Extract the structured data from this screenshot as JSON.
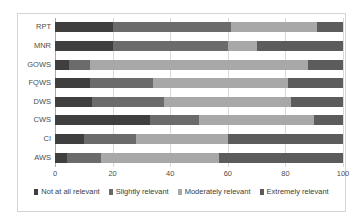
{
  "chart_data": {
    "type": "bar",
    "orientation": "horizontal",
    "stacked": true,
    "stack_mode": "percent",
    "title": "",
    "xlabel": "",
    "ylabel": "",
    "xlim": [
      0,
      100
    ],
    "xticks": [
      "0",
      "20",
      "40",
      "60",
      "80",
      "100"
    ],
    "xtick_values": [
      0,
      20,
      40,
      60,
      80,
      100
    ],
    "grid": true,
    "grid_axis": "x",
    "legend_position": "bottom",
    "categories": [
      "AWS",
      "CI",
      "CWS",
      "DWS",
      "FQWS",
      "GOWS",
      "MNR",
      "RPT"
    ],
    "categories_top_to_bottom": [
      "RPT",
      "MNR",
      "GOWS",
      "FQWS",
      "DWS",
      "CWS",
      "CI",
      "AWS"
    ],
    "series": [
      {
        "name": "Not at all relevant",
        "color": "#3f3f3f",
        "values": [
          4,
          10,
          33,
          13,
          12,
          5,
          20,
          20
        ]
      },
      {
        "name": "Slightly relevant",
        "color": "#6b6b6b",
        "values": [
          12,
          18,
          17,
          25,
          22,
          7,
          40,
          41
        ]
      },
      {
        "name": "Moderately relevant",
        "color": "#a8a8a8",
        "values": [
          41,
          32,
          40,
          44,
          47,
          76,
          10,
          30
        ]
      },
      {
        "name": "Extremely relevant",
        "color": "#5c5c5c",
        "values": [
          43,
          40,
          10,
          18,
          19,
          12,
          30,
          9
        ]
      }
    ]
  },
  "legend": {
    "items": [
      {
        "label": "Not at all relevant",
        "color": "#3f3f3f"
      },
      {
        "label": "Slightly relevant",
        "color": "#6b6b6b"
      },
      {
        "label": "Moderately relevant",
        "color": "#a8a8a8"
      },
      {
        "label": "Extremely relevant",
        "color": "#5c5c5c"
      }
    ]
  },
  "colors": {
    "background": "#ffffff",
    "frame": "#d4d4d4",
    "gridline": "#d9d9d9",
    "axis": "#aaaaaa",
    "tick_text": "#4d4d4d"
  }
}
